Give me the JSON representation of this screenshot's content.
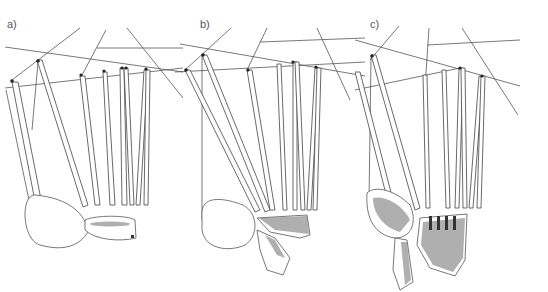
{
  "figure": {
    "panels": [
      {
        "id": "a",
        "label": "a)"
      },
      {
        "id": "b",
        "label": "b)"
      },
      {
        "id": "c",
        "label": "c)"
      }
    ],
    "colors": {
      "background": "#ffffff",
      "line": "#444444",
      "label": "#555555"
    }
  }
}
